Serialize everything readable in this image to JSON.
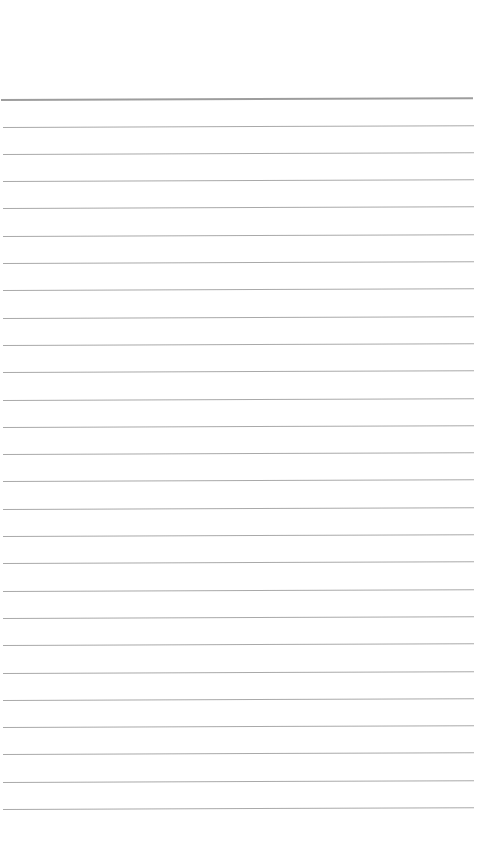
{
  "page": {
    "type": "blank lined paper",
    "background_color": "#ffffff",
    "line_color": "#9a9a9a",
    "header_line": {
      "y": 99,
      "thickness": 2
    },
    "lines": {
      "count": 26,
      "first_y": 126.5,
      "spacing": 27.3,
      "left_x": 3,
      "right_x": 474
    },
    "text": ""
  }
}
